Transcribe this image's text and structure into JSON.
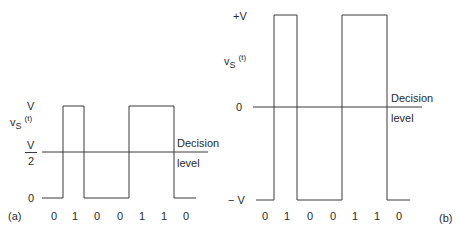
{
  "panels": [
    {
      "id": "a",
      "panel_label": "(a)",
      "signal_label": {
        "v": "v",
        "sub": "S",
        "arg": "(t)"
      },
      "y_levels": {
        "top": "V",
        "half_num": "V",
        "half_den": "2",
        "bottom": "0"
      },
      "decision_label_1": "Decision",
      "decision_label_2": "level",
      "bits": [
        "0",
        "1",
        "0",
        "0",
        "1",
        "1",
        "0"
      ],
      "encoding": "unipolar NRZ"
    },
    {
      "id": "b",
      "panel_label": "(b)",
      "signal_label": {
        "v": "v",
        "sub": "S",
        "arg": "(t)"
      },
      "y_levels": {
        "top": "+V",
        "middle": "0",
        "bottom": "− V"
      },
      "decision_label_1": "Decision",
      "decision_label_2": "level",
      "bits": [
        "0",
        "1",
        "0",
        "0",
        "1",
        "1",
        "0"
      ],
      "encoding": "polar NRZ"
    }
  ],
  "colors": {
    "line": "#3a3a3a",
    "text": "#2a2a2a",
    "background": "#ffffff"
  }
}
